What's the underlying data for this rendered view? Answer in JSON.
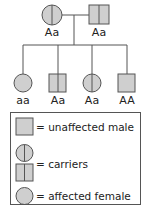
{
  "colors": {
    "fill": "#cfcfcf",
    "stroke": "#555555"
  },
  "pedigree": {
    "parents": [
      {
        "sex": "female",
        "status": "carrier",
        "genotype": "Aa"
      },
      {
        "sex": "male",
        "status": "carrier",
        "genotype": "Aa"
      }
    ],
    "children": [
      {
        "sex": "female",
        "status": "affected",
        "genotype": "aa"
      },
      {
        "sex": "male",
        "status": "carrier",
        "genotype": "Aa"
      },
      {
        "sex": "female",
        "status": "carrier",
        "genotype": "Aa"
      },
      {
        "sex": "male",
        "status": "unaffected",
        "genotype": "AA"
      }
    ]
  },
  "legend": {
    "items": [
      {
        "symbol": "filled-square",
        "label": "= unaffected male"
      },
      {
        "symbol": "half-circle-and-half-square",
        "label": "= carriers"
      },
      {
        "symbol": "filled-circle",
        "label": "= affected female"
      }
    ]
  }
}
